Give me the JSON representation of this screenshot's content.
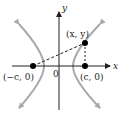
{
  "diagram": {
    "type": "hyperbola-foci",
    "axes": {
      "x_label": "x",
      "y_label": "y",
      "origin_label": "0"
    },
    "points": {
      "left_focus": "(−c, 0)",
      "right_focus": "(c, 0)",
      "curve_point": "(x, y)"
    },
    "colors": {
      "curve": "#a7a9ac",
      "axis": "#231f20",
      "point": "#000000"
    }
  }
}
